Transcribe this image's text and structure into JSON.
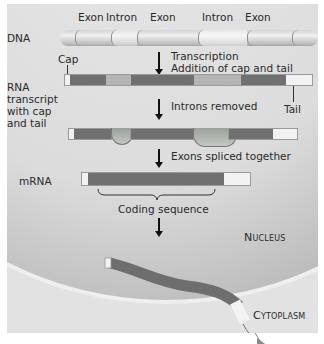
{
  "diagram": {
    "dna": {
      "label": "DNA",
      "segments": [
        "Exon",
        "Intron",
        "Exon",
        "Intron",
        "Exon"
      ]
    },
    "steps": {
      "transcription": "Transcription",
      "addition": "Addition of cap and tail",
      "introns_removed": "Introns removed",
      "exons_spliced": "Exons spliced together"
    },
    "rna_transcript": {
      "label_lines": [
        "RNA",
        "transcript",
        "with cap",
        "and tail"
      ],
      "cap_label": "Cap",
      "tail_label": "Tail"
    },
    "mrna": {
      "label": "mRNA",
      "coding_label": "Coding sequence"
    },
    "compartments": {
      "nucleus": "Nucleus",
      "cytoplasm": "Cytoplasm"
    },
    "colors": {
      "exon": "#707070",
      "intron": "#b4b4b4",
      "cap_tail": "#f2f2f2",
      "background": "#e2e2e2"
    }
  }
}
